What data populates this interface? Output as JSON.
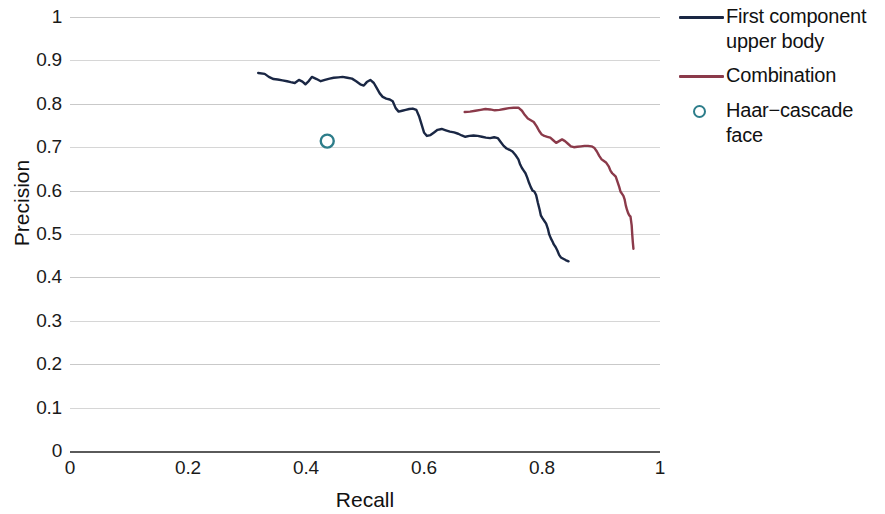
{
  "chart_data": {
    "type": "line",
    "title": "",
    "xlabel": "Recall",
    "ylabel": "Precision",
    "xlim": [
      0,
      1
    ],
    "ylim": [
      0,
      1
    ],
    "xticks": [
      "0",
      "0.2",
      "0.4",
      "0.6",
      "0.8",
      "1"
    ],
    "xtick_values": [
      0,
      0.2,
      0.4,
      0.6,
      0.8,
      1
    ],
    "yticks": [
      "0",
      "0.1",
      "0.2",
      "0.3",
      "0.4",
      "0.5",
      "0.6",
      "0.7",
      "0.8",
      "0.9",
      "1"
    ],
    "ytick_values": [
      0,
      0.1,
      0.2,
      0.3,
      0.4,
      0.5,
      0.6,
      0.7,
      0.8,
      0.9,
      1.0
    ],
    "grid": true,
    "grid_axis": "y",
    "legend_position": "right",
    "colors": {
      "first_component_upper_body": "#1a2744",
      "combination": "#8b3a4a",
      "haar_cascade_face": "#2d7d8a",
      "gridline": "#c9c9c9",
      "axis": "#5a5a5a",
      "background": "#ffffff"
    },
    "series": [
      {
        "name": "First component upper body",
        "type": "line",
        "color": "#1a2744",
        "points": [
          [
            0.319,
            0.871
          ],
          [
            0.33,
            0.869
          ],
          [
            0.337,
            0.862
          ],
          [
            0.345,
            0.857
          ],
          [
            0.352,
            0.856
          ],
          [
            0.36,
            0.854
          ],
          [
            0.368,
            0.852
          ],
          [
            0.374,
            0.85
          ],
          [
            0.381,
            0.848
          ],
          [
            0.388,
            0.855
          ],
          [
            0.394,
            0.851
          ],
          [
            0.399,
            0.845
          ],
          [
            0.405,
            0.853
          ],
          [
            0.41,
            0.862
          ],
          [
            0.418,
            0.857
          ],
          [
            0.425,
            0.852
          ],
          [
            0.432,
            0.855
          ],
          [
            0.44,
            0.858
          ],
          [
            0.447,
            0.86
          ],
          [
            0.455,
            0.861
          ],
          [
            0.462,
            0.862
          ],
          [
            0.47,
            0.86
          ],
          [
            0.478,
            0.858
          ],
          [
            0.485,
            0.852
          ],
          [
            0.492,
            0.845
          ],
          [
            0.498,
            0.842
          ],
          [
            0.503,
            0.85
          ],
          [
            0.509,
            0.855
          ],
          [
            0.515,
            0.848
          ],
          [
            0.52,
            0.836
          ],
          [
            0.525,
            0.824
          ],
          [
            0.53,
            0.816
          ],
          [
            0.536,
            0.812
          ],
          [
            0.542,
            0.81
          ],
          [
            0.547,
            0.806
          ],
          [
            0.552,
            0.79
          ],
          [
            0.557,
            0.782
          ],
          [
            0.563,
            0.784
          ],
          [
            0.569,
            0.786
          ],
          [
            0.575,
            0.788
          ],
          [
            0.581,
            0.789
          ],
          [
            0.587,
            0.786
          ],
          [
            0.592,
            0.77
          ],
          [
            0.596,
            0.752
          ],
          [
            0.6,
            0.734
          ],
          [
            0.605,
            0.726
          ],
          [
            0.611,
            0.728
          ],
          [
            0.617,
            0.734
          ],
          [
            0.623,
            0.74
          ],
          [
            0.63,
            0.742
          ],
          [
            0.637,
            0.739
          ],
          [
            0.644,
            0.736
          ],
          [
            0.651,
            0.734
          ],
          [
            0.658,
            0.731
          ],
          [
            0.664,
            0.727
          ],
          [
            0.67,
            0.724
          ],
          [
            0.677,
            0.726
          ],
          [
            0.684,
            0.727
          ],
          [
            0.691,
            0.726
          ],
          [
            0.698,
            0.724
          ],
          [
            0.705,
            0.722
          ],
          [
            0.712,
            0.721
          ],
          [
            0.719,
            0.723
          ],
          [
            0.725,
            0.721
          ],
          [
            0.73,
            0.712
          ],
          [
            0.735,
            0.703
          ],
          [
            0.74,
            0.697
          ],
          [
            0.745,
            0.694
          ],
          [
            0.75,
            0.69
          ],
          [
            0.755,
            0.682
          ],
          [
            0.76,
            0.672
          ],
          [
            0.763,
            0.66
          ],
          [
            0.766,
            0.652
          ],
          [
            0.769,
            0.646
          ],
          [
            0.772,
            0.64
          ],
          [
            0.775,
            0.63
          ],
          [
            0.778,
            0.618
          ],
          [
            0.781,
            0.608
          ],
          [
            0.784,
            0.6
          ],
          [
            0.787,
            0.598
          ],
          [
            0.79,
            0.59
          ],
          [
            0.793,
            0.572
          ],
          [
            0.796,
            0.556
          ],
          [
            0.798,
            0.543
          ],
          [
            0.801,
            0.536
          ],
          [
            0.804,
            0.53
          ],
          [
            0.807,
            0.524
          ],
          [
            0.81,
            0.512
          ],
          [
            0.812,
            0.5
          ],
          [
            0.815,
            0.49
          ],
          [
            0.818,
            0.482
          ],
          [
            0.82,
            0.476
          ],
          [
            0.823,
            0.47
          ],
          [
            0.826,
            0.462
          ],
          [
            0.829,
            0.452
          ],
          [
            0.832,
            0.446
          ],
          [
            0.836,
            0.443
          ],
          [
            0.84,
            0.44
          ],
          [
            0.845,
            0.437
          ]
        ]
      },
      {
        "name": "Combination",
        "type": "line",
        "color": "#8b3a4a",
        "points": [
          [
            0.669,
            0.781
          ],
          [
            0.678,
            0.782
          ],
          [
            0.687,
            0.784
          ],
          [
            0.696,
            0.786
          ],
          [
            0.704,
            0.788
          ],
          [
            0.712,
            0.787
          ],
          [
            0.72,
            0.785
          ],
          [
            0.728,
            0.786
          ],
          [
            0.736,
            0.788
          ],
          [
            0.744,
            0.79
          ],
          [
            0.752,
            0.791
          ],
          [
            0.76,
            0.791
          ],
          [
            0.766,
            0.784
          ],
          [
            0.771,
            0.774
          ],
          [
            0.776,
            0.766
          ],
          [
            0.781,
            0.762
          ],
          [
            0.786,
            0.758
          ],
          [
            0.791,
            0.748
          ],
          [
            0.795,
            0.738
          ],
          [
            0.799,
            0.73
          ],
          [
            0.804,
            0.726
          ],
          [
            0.809,
            0.724
          ],
          [
            0.814,
            0.722
          ],
          [
            0.819,
            0.716
          ],
          [
            0.824,
            0.71
          ],
          [
            0.829,
            0.714
          ],
          [
            0.834,
            0.718
          ],
          [
            0.839,
            0.714
          ],
          [
            0.844,
            0.708
          ],
          [
            0.849,
            0.702
          ],
          [
            0.854,
            0.7
          ],
          [
            0.86,
            0.701
          ],
          [
            0.866,
            0.702
          ],
          [
            0.872,
            0.703
          ],
          [
            0.878,
            0.703
          ],
          [
            0.884,
            0.702
          ],
          [
            0.889,
            0.698
          ],
          [
            0.893,
            0.69
          ],
          [
            0.897,
            0.68
          ],
          [
            0.901,
            0.672
          ],
          [
            0.905,
            0.668
          ],
          [
            0.909,
            0.664
          ],
          [
            0.913,
            0.656
          ],
          [
            0.916,
            0.646
          ],
          [
            0.919,
            0.64
          ],
          [
            0.922,
            0.636
          ],
          [
            0.925,
            0.632
          ],
          [
            0.928,
            0.62
          ],
          [
            0.931,
            0.608
          ],
          [
            0.933,
            0.598
          ],
          [
            0.936,
            0.592
          ],
          [
            0.938,
            0.588
          ],
          [
            0.94,
            0.58
          ],
          [
            0.942,
            0.566
          ],
          [
            0.944,
            0.556
          ],
          [
            0.946,
            0.548
          ],
          [
            0.948,
            0.543
          ],
          [
            0.95,
            0.54
          ],
          [
            0.952,
            0.52
          ],
          [
            0.953,
            0.498
          ],
          [
            0.954,
            0.48
          ],
          [
            0.955,
            0.466
          ]
        ]
      },
      {
        "name": "Haar-cascade face",
        "type": "scatter",
        "color": "#2d7d8a",
        "points": [
          [
            0.436,
            0.714
          ]
        ]
      }
    ]
  },
  "legend": {
    "items": [
      {
        "label": "First component upper body",
        "key": "line",
        "color": "#1a2744"
      },
      {
        "label": "Combination",
        "key": "line",
        "color": "#8b3a4a"
      },
      {
        "label": "Haar−cascade face",
        "key": "marker",
        "color": "#2d7d8a"
      }
    ]
  },
  "axes": {
    "x_title": "Recall",
    "y_title": "Precision",
    "x_tick_labels": [
      "0",
      "0.2",
      "0.4",
      "0.6",
      "0.8",
      "1"
    ],
    "y_tick_labels": [
      "0",
      "0.1",
      "0.2",
      "0.3",
      "0.4",
      "0.5",
      "0.6",
      "0.7",
      "0.8",
      "0.9",
      "1"
    ]
  }
}
